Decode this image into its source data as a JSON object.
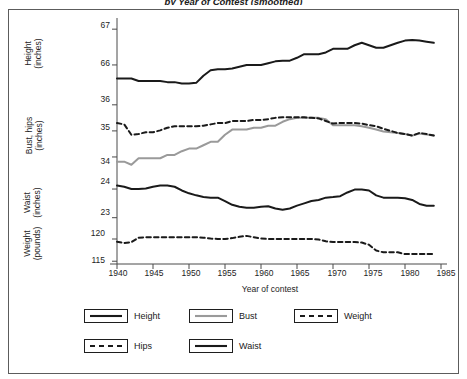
{
  "figure": {
    "title": "by Year of Contest (smoothed)",
    "border_color": "#5c5c5c"
  },
  "axes": {
    "xlabel": "Year of contest",
    "xticks": [
      "1940",
      "1945",
      "1950",
      "1955",
      "1960",
      "1965",
      "1970",
      "1975",
      "1980",
      "1985"
    ],
    "panels": [
      {
        "name": "height",
        "label_lines": [
          "Height",
          "(inches)"
        ],
        "yticks": [
          "67",
          "66"
        ]
      },
      {
        "name": "bust_hips",
        "label_lines": [
          "Bust, hips",
          "(inches)"
        ],
        "yticks": [
          "36",
          "35",
          "34"
        ]
      },
      {
        "name": "waist",
        "label_lines": [
          "Waist",
          "(inches)"
        ],
        "yticks": [
          "24",
          "23"
        ]
      },
      {
        "name": "weight",
        "label_lines": [
          "Weight",
          "(pounds)"
        ],
        "yticks": [
          "120",
          "115"
        ]
      }
    ]
  },
  "legend": {
    "position": "below-plot",
    "items": [
      {
        "label": "Height",
        "style": "solid",
        "color": "#1a1a1a",
        "swatch": "line-swatch-solid-black"
      },
      {
        "label": "Bust",
        "style": "solid",
        "color": "#9a9a9a",
        "swatch": "line-swatch-solid-gray"
      },
      {
        "label": "Weight",
        "style": "dashed",
        "color": "#1a1a1a",
        "swatch": "line-swatch-dashed-black"
      },
      {
        "label": "Hips",
        "style": "dashed",
        "color": "#1a1a1a",
        "swatch": "line-swatch-dashed-black"
      },
      {
        "label": "Waist",
        "style": "solid",
        "color": "#1a1a1a",
        "swatch": "line-swatch-solid-black"
      }
    ]
  },
  "chart_data": {
    "type": "line",
    "title": "by Year of Contest (smoothed)",
    "xlabel": "Year of contest",
    "grid": false,
    "legend_position": "below",
    "x": [
      1940,
      1941,
      1942,
      1943,
      1944,
      1945,
      1946,
      1947,
      1948,
      1949,
      1950,
      1951,
      1952,
      1953,
      1954,
      1955,
      1956,
      1957,
      1958,
      1959,
      1960,
      1961,
      1962,
      1963,
      1964,
      1965,
      1966,
      1967,
      1968,
      1969,
      1970,
      1971,
      1972,
      1973,
      1974,
      1975,
      1976,
      1977,
      1978,
      1979,
      1980,
      1981,
      1982,
      1983,
      1984
    ],
    "xlim": [
      1940,
      1985
    ],
    "panels": [
      {
        "name": "height",
        "ylabel": "Height (inches)",
        "ylim": [
          65.3,
          67.2
        ],
        "yticks": [
          66,
          67
        ],
        "series": [
          {
            "name": "Height",
            "style": "solid",
            "color": "#1a1a1a",
            "values": [
              65.62,
              65.62,
              65.62,
              65.55,
              65.55,
              65.55,
              65.55,
              65.52,
              65.52,
              65.48,
              65.48,
              65.5,
              65.7,
              65.85,
              65.88,
              65.88,
              65.9,
              65.95,
              66.0,
              66.0,
              66.0,
              66.05,
              66.1,
              66.12,
              66.12,
              66.2,
              66.3,
              66.3,
              66.3,
              66.35,
              66.45,
              66.45,
              66.45,
              66.55,
              66.62,
              66.55,
              66.48,
              66.48,
              66.55,
              66.62,
              66.68,
              66.7,
              66.68,
              66.65,
              66.62
            ]
          }
        ]
      },
      {
        "name": "bust_hips",
        "ylabel": "Bust, hips (inches)",
        "ylim": [
          33.5,
          36.3
        ],
        "yticks": [
          34,
          35,
          36
        ],
        "series": [
          {
            "name": "Bust",
            "style": "solid",
            "color": "#9a9a9a",
            "values": [
              33.82,
              33.82,
              33.7,
              33.95,
              33.95,
              33.95,
              33.95,
              34.08,
              34.08,
              34.22,
              34.32,
              34.32,
              34.45,
              34.58,
              34.58,
              34.85,
              35.05,
              35.05,
              35.05,
              35.12,
              35.12,
              35.2,
              35.2,
              35.35,
              35.45,
              35.5,
              35.5,
              35.5,
              35.5,
              35.45,
              35.22,
              35.22,
              35.22,
              35.22,
              35.18,
              35.12,
              35.05,
              34.98,
              34.95,
              34.92,
              34.88,
              34.82,
              34.9,
              34.86,
              34.82
            ]
          },
          {
            "name": "Hips",
            "style": "dashed",
            "color": "#1a1a1a",
            "values": [
              35.3,
              35.25,
              34.85,
              34.88,
              34.95,
              34.95,
              35.02,
              35.12,
              35.18,
              35.18,
              35.18,
              35.18,
              35.2,
              35.25,
              35.3,
              35.3,
              35.38,
              35.38,
              35.38,
              35.42,
              35.42,
              35.45,
              35.5,
              35.52,
              35.52,
              35.52,
              35.52,
              35.5,
              35.48,
              35.38,
              35.28,
              35.3,
              35.3,
              35.3,
              35.28,
              35.22,
              35.18,
              35.08,
              35.0,
              34.92,
              34.88,
              34.82,
              34.92,
              34.88,
              34.82
            ]
          }
        ]
      },
      {
        "name": "waist",
        "ylabel": "Waist (inches)",
        "ylim": [
          22.85,
          24.35
        ],
        "yticks": [
          23,
          24
        ],
        "series": [
          {
            "name": "Waist",
            "style": "solid",
            "color": "#1a1a1a",
            "values": [
              24.12,
              24.08,
              24.0,
              24.0,
              24.02,
              24.08,
              24.12,
              24.12,
              24.08,
              23.95,
              23.85,
              23.78,
              23.72,
              23.7,
              23.7,
              23.58,
              23.45,
              23.38,
              23.35,
              23.35,
              23.38,
              23.4,
              23.32,
              23.28,
              23.32,
              23.42,
              23.5,
              23.58,
              23.62,
              23.7,
              23.72,
              23.75,
              23.88,
              23.98,
              23.98,
              23.95,
              23.78,
              23.7,
              23.7,
              23.7,
              23.68,
              23.62,
              23.48,
              23.42,
              23.42
            ]
          }
        ]
      },
      {
        "name": "weight",
        "ylabel": "Weight (pounds)",
        "ylim": [
          114.6,
          121.8
        ],
        "yticks": [
          115,
          120
        ],
        "series": [
          {
            "name": "Weight",
            "style": "dashed",
            "color": "#1a1a1a",
            "values": [
              119.4,
              119.1,
              119.3,
              120.3,
              120.4,
              120.4,
              120.4,
              120.4,
              120.4,
              120.4,
              120.4,
              120.4,
              120.3,
              120.1,
              120.0,
              120.0,
              120.2,
              120.5,
              120.7,
              120.4,
              120.1,
              120.0,
              120.0,
              120.0,
              120.0,
              120.0,
              120.0,
              120.0,
              119.9,
              119.5,
              119.3,
              119.3,
              119.3,
              119.3,
              119.2,
              118.7,
              117.4,
              117.0,
              117.0,
              117.0,
              116.6,
              116.6,
              116.6,
              116.6,
              116.6
            ]
          }
        ]
      }
    ]
  }
}
